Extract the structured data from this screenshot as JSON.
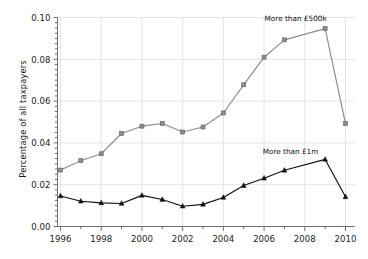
{
  "chart_data": {
    "type": "line",
    "title": "",
    "xlabel": "",
    "ylabel": "Percentage of all taxpayers",
    "xlim": [
      1995.5,
      2010.5
    ],
    "ylim": [
      0.0,
      0.1
    ],
    "grid": true,
    "legend_position": "inline-annotations",
    "x": [
      1996,
      1997,
      1998,
      1999,
      2000,
      2001,
      2002,
      2003,
      2004,
      2005,
      2006,
      2007,
      2008,
      2009,
      2010
    ],
    "xtick_labels": [
      "1996",
      "1998",
      "2000",
      "2002",
      "2004",
      "2006",
      "2008",
      "2010"
    ],
    "xtick_values": [
      1996,
      1998,
      2000,
      2002,
      2004,
      2006,
      2008,
      2010
    ],
    "xminor_tick_values": [
      1997,
      1999,
      2001,
      2003,
      2005,
      2007,
      2009
    ],
    "ytick_labels": [
      "0.00",
      "0.02",
      "0.04",
      "0.06",
      "0.08",
      "0.10"
    ],
    "ytick_values": [
      0.0,
      0.02,
      0.04,
      0.06,
      0.08,
      0.1
    ],
    "yminor_step": 0.0025,
    "series": [
      {
        "name": "More than £500k",
        "color": "#8c8c8c",
        "marker": "square",
        "annotation": "More than £500k",
        "x": [
          1996,
          1997,
          1998,
          1999,
          2000,
          2001,
          2002,
          2003,
          2004,
          2005,
          2006,
          2007,
          2009,
          2010
        ],
        "values": [
          0.027,
          0.0315,
          0.0348,
          0.0445,
          0.048,
          0.0493,
          0.0452,
          0.0476,
          0.0543,
          0.0678,
          0.081,
          0.0893,
          0.0947,
          0.0492
        ]
      },
      {
        "name": "More than £1m",
        "color": "#111111",
        "marker": "triangle",
        "annotation": "More than £1m",
        "x": [
          1996,
          1997,
          1998,
          1999,
          2000,
          2001,
          2002,
          2003,
          2004,
          2005,
          2006,
          2007,
          2009,
          2010
        ],
        "values": [
          0.0146,
          0.0121,
          0.0113,
          0.011,
          0.0149,
          0.0129,
          0.0097,
          0.0106,
          0.0139,
          0.0196,
          0.0231,
          0.0269,
          0.0321,
          0.0142
        ]
      }
    ],
    "annotations": [
      {
        "text": "More than £500k",
        "x": 2007.55,
        "y": 0.0985
      },
      {
        "text": "More than £1m",
        "x": 2007.3,
        "y": 0.0345
      }
    ],
    "colors": {
      "series_500k": "#8c8c8c",
      "series_1m": "#111111",
      "grid": "#e4e4e4",
      "axis": "#6e6e6e",
      "text": "#1a1a1a",
      "background": "#ffffff"
    }
  }
}
